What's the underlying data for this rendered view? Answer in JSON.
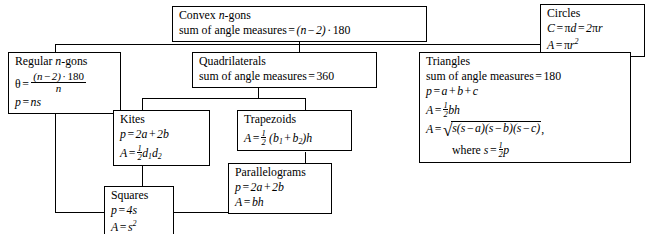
{
  "diagram": {
    "line_color": "#000000",
    "box_border_color": "#000000",
    "background": "#ffffff"
  },
  "nodes": {
    "convex_ngons": {
      "title": "Convex n-gons",
      "lines": [
        "sum of angle measures = (n − 2) · 180"
      ]
    },
    "circles": {
      "title": "Circles",
      "lines": [
        "C = πd = 2πr",
        "A = πr²"
      ]
    },
    "regular_ngons": {
      "title": "Regular n-gons",
      "lines": [
        "θ = (n − 2) · 180 / n",
        "p = ns"
      ]
    },
    "quadrilaterals": {
      "title": "Quadrilaterals",
      "lines": [
        "sum of angle measures = 360"
      ]
    },
    "triangles": {
      "title": "Triangles",
      "lines": [
        "sum of angle measures = 180",
        "p = a + b + c",
        "A = ½bh",
        "A = √(s(s − a)(s − b)(s − c)),",
        "where s = ½p"
      ]
    },
    "kites": {
      "title": "Kites",
      "lines": [
        "p = 2a + 2b",
        "A = ½d₁d₂"
      ]
    },
    "trapezoids": {
      "title": "Trapezoids",
      "lines": [
        "A = ½ (b₁ + b₂)h"
      ]
    },
    "parallelograms": {
      "title": "Parallelograms",
      "lines": [
        "p = 2a + 2b",
        "A = bh"
      ]
    },
    "squares": {
      "title": "Squares",
      "lines": [
        "p = 4s",
        "A = s²"
      ]
    }
  }
}
